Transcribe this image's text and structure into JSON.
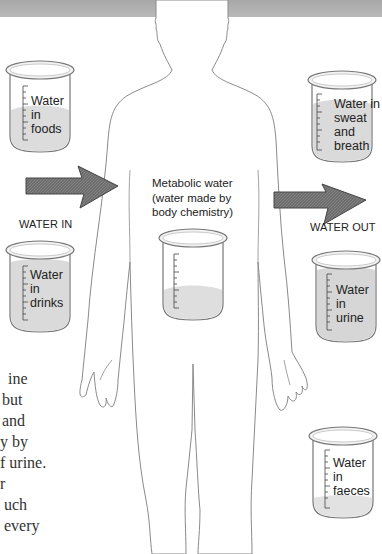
{
  "colors": {
    "header_band": "#b0b0b0",
    "arrow_fill": "#666666",
    "outline": "#888888",
    "water_fill": "#d9d9d9",
    "text": "#222222"
  },
  "arrows": {
    "in_label": "WATER IN",
    "out_label": "WATER OUT"
  },
  "metabolic": {
    "line1": "Metabolic water",
    "line2": "(water made by",
    "line3": "body chemistry)"
  },
  "beakers": [
    {
      "id": "foods",
      "lines": [
        "Water",
        "in",
        "foods"
      ]
    },
    {
      "id": "drinks",
      "lines": [
        "Water",
        "in",
        "drinks"
      ]
    },
    {
      "id": "sweat",
      "lines": [
        "Water in",
        "sweat",
        "and",
        "breath"
      ]
    },
    {
      "id": "urine",
      "lines": [
        "Water",
        "in",
        "urine"
      ]
    },
    {
      "id": "faeces",
      "lines": [
        "Water",
        "in",
        "faeces"
      ]
    }
  ],
  "body_text_fragments": [
    "ine",
    "but",
    "and",
    "y by",
    "f urine.",
    "r",
    "uch",
    "every"
  ]
}
